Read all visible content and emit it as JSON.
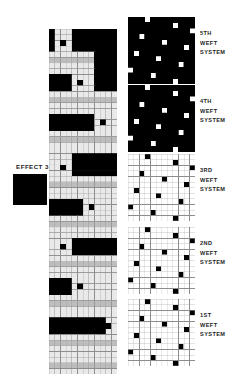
{
  "effect": {
    "label": "EFFECT 3",
    "swatch_color": "#000000",
    "swatch_name": "effect-3-swatch"
  },
  "palette": {
    "black": "#000000",
    "white": "#ffffff",
    "cell_light": "#e9e9e9",
    "cell_mid": "#bdbdbd",
    "cell_dark": "#9a9a9a",
    "grid_line": "#8d8d8d",
    "text": "#1d1d1d"
  },
  "cross_section": {
    "name": "weave-cross-section",
    "columns": 12,
    "rows": 61,
    "cell_w": 5.6667,
    "cell_h": 5.6557,
    "legend": "0 = light warp cell, 1 = black float, 2 = mid-grey weft band",
    "rows_data": [
      "100011111111",
      "100011111111",
      "101011111111",
      "100011111111",
      "000000001111",
      "222222221111",
      "000000001111",
      "000000001111",
      "111100001111",
      "111101001111",
      "111100001111",
      "000000000000",
      "222222222222",
      "000000000000",
      "000000000000",
      "111111110000",
      "111111110100",
      "111111110000",
      "000000000000",
      "222222222222",
      "000000000000",
      "000000000000",
      "000011111111",
      "000011111111",
      "001011111111",
      "000011111111",
      "000000000000",
      "222222222222",
      "000000000000",
      "000000000000",
      "111111000000",
      "111111010000",
      "111111000000",
      "000000000000",
      "222222222222",
      "000000000000",
      "000000000000",
      "000011111111",
      "001011111111",
      "000011111111",
      "000000000000",
      "222222222222",
      "000000000000",
      "000000000000",
      "111100000000",
      "111101000000",
      "111100000000",
      "000000000000",
      "222222222222",
      "000000000000",
      "000000000000",
      "111111111100",
      "111111111110",
      "111111111100",
      "000000000000",
      "222222222222",
      "000000000000",
      "000000000000",
      "000000000000",
      "222222222222",
      "000000000000"
    ]
  },
  "weft_systems": [
    {
      "id": "5th",
      "name": "weft-system-5th",
      "label_lines": [
        "5TH",
        "WEFT",
        "SYSTEM"
      ],
      "inverted": true,
      "background": "#000000",
      "dot_color": "#ffffff",
      "gridlines": false,
      "size": 12,
      "dots": [
        [
          3,
          0
        ],
        [
          8,
          1
        ],
        [
          11,
          2
        ],
        [
          2,
          3
        ],
        [
          6,
          4
        ],
        [
          10,
          5
        ],
        [
          1,
          6
        ],
        [
          5,
          7
        ],
        [
          9,
          8
        ],
        [
          0,
          9
        ],
        [
          4,
          10
        ],
        [
          8,
          11
        ]
      ]
    },
    {
      "id": "4th",
      "name": "weft-system-4th",
      "label_lines": [
        "4TH",
        "WEFT",
        "SYSTEM"
      ],
      "inverted": true,
      "background": "#000000",
      "dot_color": "#ffffff",
      "gridlines": false,
      "size": 12,
      "dots": [
        [
          3,
          0
        ],
        [
          8,
          1
        ],
        [
          11,
          2
        ],
        [
          2,
          3
        ],
        [
          6,
          4
        ],
        [
          10,
          5
        ],
        [
          1,
          6
        ],
        [
          5,
          7
        ],
        [
          9,
          8
        ],
        [
          0,
          9
        ],
        [
          4,
          10
        ],
        [
          8,
          11
        ]
      ]
    },
    {
      "id": "3rd",
      "name": "weft-system-3rd",
      "label_lines": [
        "3RD",
        "WEFT",
        "SYSTEM"
      ],
      "inverted": false,
      "background": "#ffffff",
      "dot_color": "#000000",
      "gridlines": true,
      "size": 12,
      "dots": [
        [
          3,
          0
        ],
        [
          8,
          1
        ],
        [
          11,
          2
        ],
        [
          2,
          3
        ],
        [
          6,
          4
        ],
        [
          10,
          5
        ],
        [
          1,
          6
        ],
        [
          5,
          7
        ],
        [
          9,
          8
        ],
        [
          0,
          9
        ],
        [
          4,
          10
        ],
        [
          8,
          11
        ]
      ]
    },
    {
      "id": "2nd",
      "name": "weft-system-2nd",
      "label_lines": [
        "2ND",
        "WEFT",
        "SYSTEM"
      ],
      "inverted": false,
      "background": "#ffffff",
      "dot_color": "#000000",
      "gridlines": true,
      "size": 12,
      "dots": [
        [
          3,
          0
        ],
        [
          8,
          1
        ],
        [
          11,
          2
        ],
        [
          2,
          3
        ],
        [
          6,
          4
        ],
        [
          10,
          5
        ],
        [
          1,
          6
        ],
        [
          5,
          7
        ],
        [
          9,
          8
        ],
        [
          0,
          9
        ],
        [
          4,
          10
        ],
        [
          8,
          11
        ]
      ]
    },
    {
      "id": "1st",
      "name": "weft-system-1st",
      "label_lines": [
        "1ST",
        "WEFT",
        "SYSTEM"
      ],
      "inverted": false,
      "background": "#ffffff",
      "dot_color": "#000000",
      "gridlines": true,
      "size": 12,
      "dots": [
        [
          3,
          0
        ],
        [
          8,
          1
        ],
        [
          11,
          2
        ],
        [
          2,
          3
        ],
        [
          6,
          4
        ],
        [
          10,
          5
        ],
        [
          1,
          6
        ],
        [
          5,
          7
        ],
        [
          9,
          8
        ],
        [
          0,
          9
        ],
        [
          4,
          10
        ],
        [
          8,
          11
        ]
      ]
    }
  ],
  "layout": {
    "weft_row_tops": [
      17,
      85,
      154,
      227,
      299
    ]
  }
}
